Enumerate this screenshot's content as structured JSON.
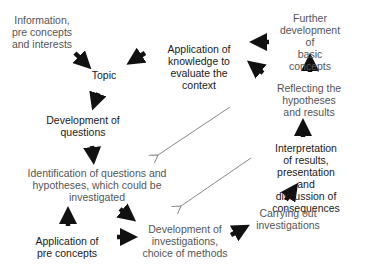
{
  "diagram": {
    "nodes": [
      {
        "id": "information",
        "text": "Information,\npre concepts\nand interests",
        "tone": "grey"
      },
      {
        "id": "topic",
        "text": "Topic",
        "tone": "dark"
      },
      {
        "id": "application_knowledge",
        "text": "Application of\nknowledge to\nevaluate the\ncontext",
        "tone": "dark"
      },
      {
        "id": "further_development",
        "text": "Further\ndevelopment of\nbasic concepts",
        "tone": "grey"
      },
      {
        "id": "development_questions",
        "text": "Development of\nquestions",
        "tone": "dark"
      },
      {
        "id": "reflecting",
        "text": "Reflecting the\nhypotheses and results",
        "tone": "grey"
      },
      {
        "id": "identification",
        "text": "Identification of questions and\nhypotheses, which could be\ninvestigated",
        "tone": "grey"
      },
      {
        "id": "interpretation",
        "text": "Interpretation of results,\npresentation and\ndiscussion of\nconsequences",
        "tone": "dark"
      },
      {
        "id": "carrying_out",
        "text": "Carrying out\ninvestigations",
        "tone": "grey"
      },
      {
        "id": "application_preconcepts",
        "text": "Application of\npre concepts",
        "tone": "dark"
      },
      {
        "id": "development_investigations",
        "text": "Development of\ninvestigations,\nchoice of methods",
        "tone": "grey"
      }
    ],
    "edges": [
      {
        "from": "information",
        "to": "topic",
        "style": "bold"
      },
      {
        "from": "application_knowledge",
        "to": "topic",
        "style": "bold"
      },
      {
        "from": "topic",
        "to": "development_questions",
        "style": "bold"
      },
      {
        "from": "development_questions",
        "to": "identification",
        "style": "bold"
      },
      {
        "from": "identification",
        "to": "development_investigations",
        "style": "bold"
      },
      {
        "from": "application_preconcepts",
        "to": "identification",
        "style": "bold"
      },
      {
        "from": "application_preconcepts",
        "to": "development_investigations",
        "style": "bold"
      },
      {
        "from": "development_investigations",
        "to": "carrying_out",
        "style": "bold"
      },
      {
        "from": "carrying_out",
        "to": "interpretation",
        "style": "bold"
      },
      {
        "from": "interpretation",
        "to": "reflecting",
        "style": "bold"
      },
      {
        "from": "reflecting",
        "to": "further_development",
        "style": "bold"
      },
      {
        "from": "reflecting",
        "to": "application_knowledge",
        "style": "bold"
      },
      {
        "from": "further_development",
        "to": "application_knowledge",
        "style": "bold"
      },
      {
        "from": "reflecting",
        "to": "identification",
        "style": "thin"
      },
      {
        "from": "interpretation",
        "to": "development_investigations",
        "style": "thin"
      }
    ]
  },
  "colors": {
    "dark_text": "#1a1a1a",
    "grey_text": "#555555",
    "bold_arrow": "#111111",
    "thin_arrow": "#888888"
  }
}
